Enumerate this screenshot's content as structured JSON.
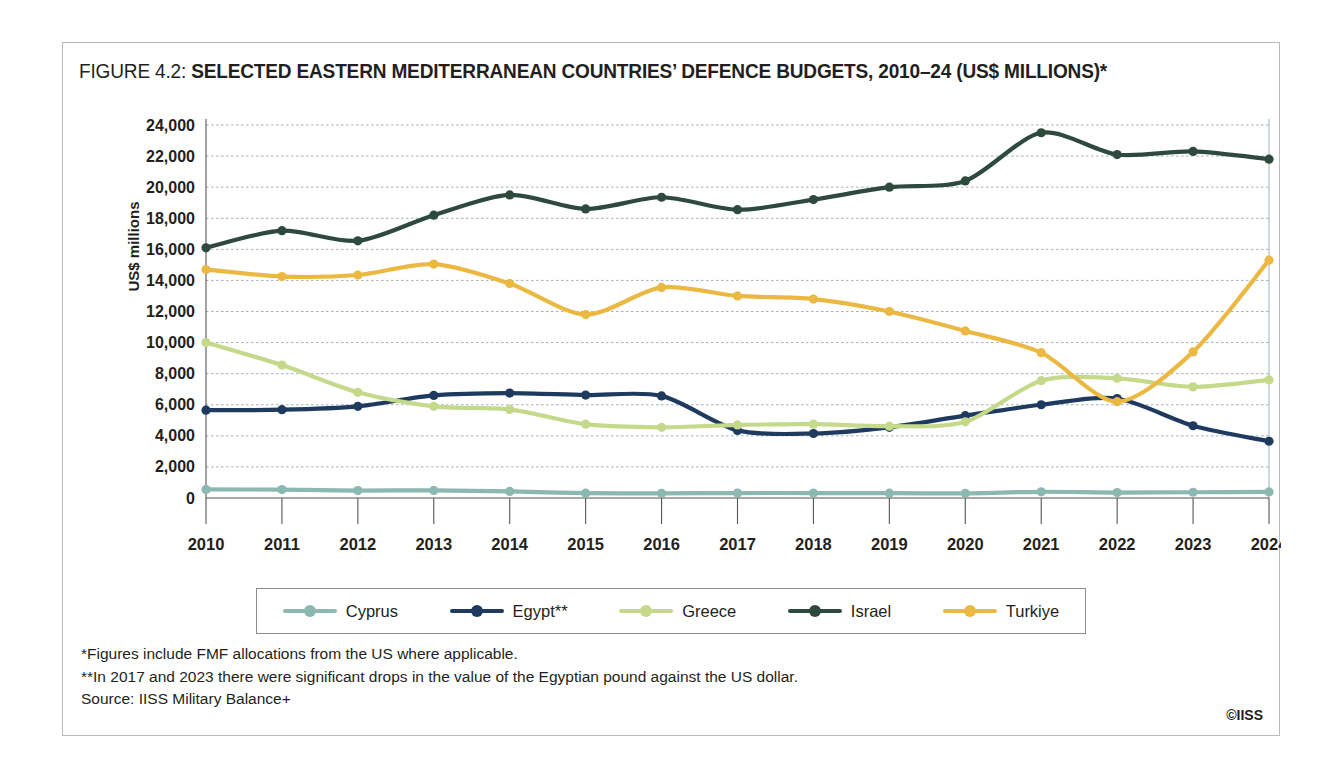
{
  "figure": {
    "label": "FIGURE 4.2:",
    "title": "SELECTED EASTERN MEDITERRANEAN COUNTRIES’ DEFENCE BUDGETS, 2010–24 (US$ MILLIONS)*"
  },
  "footnotes": {
    "line1": "*Figures include FMF allocations from the US where applicable.",
    "line2": "**In 2017 and 2023 there were significant drops in the value of the Egyptian pound against the US dollar.",
    "line3": "Source: IISS Military Balance+"
  },
  "copyright": "©IISS",
  "chart_data": {
    "type": "line",
    "title": "SELECTED EASTERN MEDITERRANEAN COUNTRIES’ DEFENCE BUDGETS, 2010–24 (US$ MILLIONS)*",
    "xlabel": "",
    "ylabel": "US$ millions",
    "x": [
      2010,
      2011,
      2012,
      2013,
      2014,
      2015,
      2016,
      2017,
      2018,
      2019,
      2020,
      2021,
      2022,
      2023,
      2024
    ],
    "xtick_labels": [
      "2010",
      "2011",
      "2012",
      "2013",
      "2014",
      "2015",
      "2016",
      "2017",
      "2018",
      "2019",
      "2020",
      "2021",
      "2022",
      "2023",
      "2024"
    ],
    "ylim": [
      0,
      24000
    ],
    "ytick_values": [
      0,
      2000,
      4000,
      6000,
      8000,
      10000,
      12000,
      14000,
      16000,
      18000,
      20000,
      22000,
      24000
    ],
    "ytick_labels": [
      "0",
      "2,000",
      "4,000",
      "6,000",
      "8,000",
      "10,000",
      "12,000",
      "14,000",
      "16,000",
      "18,000",
      "20,000",
      "22,000",
      "24,000"
    ],
    "grid": true,
    "legend_position": "bottom",
    "series": [
      {
        "name": "Cyprus",
        "color": "#8cb8b2",
        "values": [
          550,
          540,
          480,
          490,
          420,
          310,
          300,
          320,
          320,
          310,
          300,
          400,
          350,
          370,
          390
        ]
      },
      {
        "name": "Egypt**",
        "color": "#1f3a5f",
        "values": [
          5650,
          5680,
          5900,
          6600,
          6750,
          6620,
          6570,
          4350,
          4150,
          4550,
          5300,
          6000,
          6400,
          4650,
          3650
        ]
      },
      {
        "name": "Greece",
        "color": "#c5d98b",
        "values": [
          10000,
          8550,
          6800,
          5900,
          5700,
          4750,
          4550,
          4700,
          4750,
          4620,
          4900,
          7550,
          7700,
          7150,
          7600
        ]
      },
      {
        "name": "Israel",
        "color": "#2e4a3e",
        "values": [
          16100,
          17200,
          16550,
          18200,
          19500,
          18600,
          19350,
          18550,
          19200,
          20000,
          20400,
          23500,
          22100,
          22300,
          21800
        ]
      },
      {
        "name": "Turkiye",
        "color": "#ebb942",
        "values": [
          14700,
          14250,
          14350,
          15050,
          13800,
          11800,
          13550,
          13000,
          12800,
          12000,
          10750,
          9350,
          6200,
          9400,
          15300
        ]
      }
    ]
  }
}
